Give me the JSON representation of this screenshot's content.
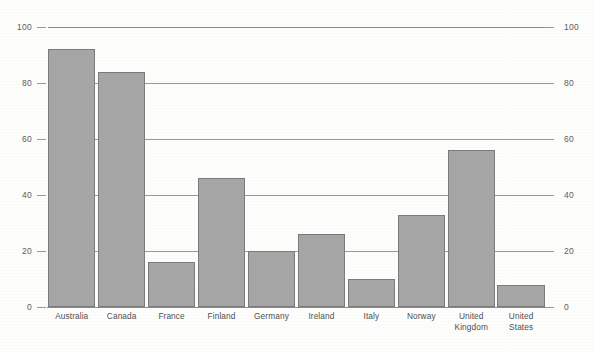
{
  "chart": {
    "title": ""
  },
  "chart_data": {
    "type": "bar",
    "title": "",
    "subtitle": "",
    "xlabel": "",
    "ylabel": "",
    "ylim": [
      0,
      100
    ],
    "yticks": [
      0,
      20,
      40,
      60,
      80,
      100
    ],
    "ytick_labels": [
      "0",
      "20",
      "40",
      "60",
      "80",
      "100"
    ],
    "grid": true,
    "dual_axis": true,
    "right_axis_ticks": [
      0,
      20,
      40,
      60,
      80,
      100
    ],
    "right_axis_tick_labels": [
      "0",
      "20",
      "40",
      "60",
      "80",
      "100"
    ],
    "legend": null,
    "legend_position": "none",
    "bar_color": "#a6a6a6",
    "bar_border_color": "#7b7b7b",
    "categories": [
      "Australia",
      "Canada",
      "France",
      "Finland",
      "Germany",
      "Ireland",
      "Italy",
      "Norway",
      "United Kingdom",
      "United States"
    ],
    "category_label_lines": [
      [
        "Australia"
      ],
      [
        "Canada"
      ],
      [
        "France"
      ],
      [
        "Finland"
      ],
      [
        "Germany"
      ],
      [
        "Ireland"
      ],
      [
        "Italy"
      ],
      [
        "Norway"
      ],
      [
        "United",
        "Kingdom"
      ],
      [
        "United States"
      ]
    ],
    "values": [
      92,
      84,
      16,
      46,
      20,
      26,
      10,
      33,
      56,
      8
    ]
  }
}
